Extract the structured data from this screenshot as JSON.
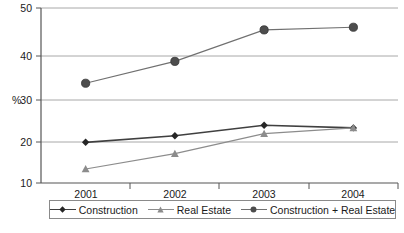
{
  "chart_data": {
    "type": "line",
    "title": "",
    "xlabel": "",
    "ylabel": "%",
    "categories": [
      "2001",
      "2002",
      "2003",
      "2004"
    ],
    "x": [
      2001,
      2002,
      2003,
      2004
    ],
    "ylim": [
      10,
      50
    ],
    "yticks": [
      10,
      20,
      30,
      40,
      50
    ],
    "ytick_labels": [
      "10",
      "20",
      "30",
      "40",
      "50"
    ],
    "grid": true,
    "grid_axis": "y",
    "legend_position": "bottom",
    "series": [
      {
        "name": "Construction",
        "marker": "diamond",
        "color": "#404040",
        "values": [
          19.3,
          20.8,
          23.2,
          22.6
        ]
      },
      {
        "name": "Real Estate",
        "marker": "triangle",
        "color": "#8c8c8c",
        "values": [
          13.2,
          16.7,
          21.3,
          22.6
        ]
      },
      {
        "name": "Construction + Real Estate",
        "marker": "circle",
        "color": "#707070",
        "values": [
          32.8,
          37.8,
          45.0,
          45.6
        ]
      }
    ]
  },
  "axes": {
    "y_axis_title": "%",
    "y_tick_50": "50",
    "y_tick_40": "40",
    "y_tick_30": "30",
    "y_tick_20": "20",
    "y_tick_10": "10",
    "x_tick_2001": "2001",
    "x_tick_2002": "2002",
    "x_tick_2003": "2003",
    "x_tick_2004": "2004"
  },
  "legend": {
    "items": [
      {
        "label": "Construction",
        "marker": "diamond-marker",
        "color": "#404040"
      },
      {
        "label": "Real Estate",
        "marker": "triangle-marker",
        "color": "#8c8c8c"
      },
      {
        "label": "Construction + Real Estate",
        "marker": "circle-marker",
        "color": "#707070"
      }
    ]
  },
  "colors": {
    "grid": "#a8a8a8",
    "axis": "#555555",
    "background": "#ffffff",
    "construction": "#404040",
    "real_estate": "#8c8c8c",
    "combined": "#707070"
  }
}
